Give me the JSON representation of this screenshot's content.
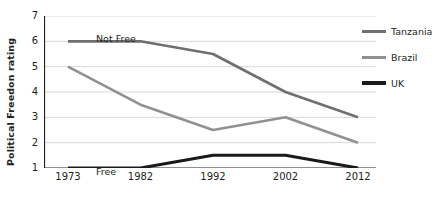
{
  "chart_data": {
    "type": "line",
    "title": "",
    "xlabel": "",
    "ylabel": "Political Freedon rating",
    "categories": [
      "1973",
      "1982",
      "1992",
      "2002",
      "2012"
    ],
    "x": [
      1973,
      1982,
      1992,
      2002,
      2012
    ],
    "ylim": [
      1,
      7
    ],
    "yticks": [
      1,
      2,
      3,
      4,
      5,
      6,
      7
    ],
    "ytick_labels": [
      "1",
      "2",
      "3",
      "4",
      "5",
      "6",
      "7"
    ],
    "grid": "horizontal",
    "legend_position": "right",
    "annotations": [
      {
        "text": "Not Free",
        "x": 1973,
        "y": 6.75,
        "name": "not-free"
      },
      {
        "text": "Free",
        "x": 1973,
        "y": 1.45,
        "name": "free"
      }
    ],
    "series": [
      {
        "name": "Tanzania",
        "color": "#6f6f6f",
        "width": 2.6,
        "values": [
          6,
          6,
          5.5,
          4,
          3
        ]
      },
      {
        "name": "Brazil",
        "color": "#919191",
        "width": 2.6,
        "values": [
          5,
          3.5,
          2.5,
          3,
          2
        ]
      },
      {
        "name": "UK",
        "color": "#1a1a1a",
        "width": 3.0,
        "values": [
          1,
          1,
          1.5,
          1.5,
          1
        ]
      }
    ]
  },
  "axis": {
    "y_title": "Political Freedon rating",
    "y_tick_labels": [
      "7",
      "6",
      "5",
      "4",
      "3",
      "2",
      "1"
    ],
    "x_tick_labels": [
      "1973",
      "1982",
      "1992",
      "2002",
      "2012"
    ]
  },
  "legend": {
    "items": [
      {
        "label": "Tanzania",
        "color": "#6f6f6f",
        "thickness": "3px"
      },
      {
        "label": "Brazil",
        "color": "#919191",
        "thickness": "3px"
      },
      {
        "label": "UK",
        "color": "#1a1a1a",
        "thickness": "4px"
      }
    ]
  },
  "zones": {
    "top": "Not Free",
    "bottom": "Free"
  },
  "colors": {
    "axis": "#231f20",
    "grid": "#d9d9d9",
    "background": "#ffffff"
  }
}
